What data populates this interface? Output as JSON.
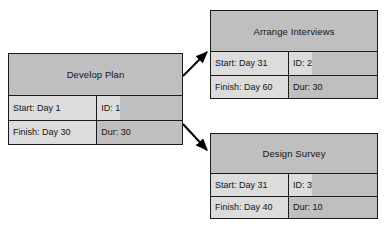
{
  "diagram": {
    "colors": {
      "node_fill_header": "#bfbfbf",
      "cell_light": "#dcdcdc",
      "cell_mid": "#bfbfbf",
      "border": "#1a1a1a",
      "arrow": "#000000",
      "background": "#ffffff"
    },
    "nodes": [
      {
        "id": "develop-plan",
        "title": "Develop Plan",
        "start": "Start: Day 1",
        "task_id": "ID: 1",
        "finish": "Finish: Day 30",
        "duration": "Dur: 30",
        "x": 8,
        "y": 53,
        "width": 175,
        "height": 92,
        "header_height": 42,
        "split_percent": 51
      },
      {
        "id": "arrange-interviews",
        "title": "Arrange Interviews",
        "start": "Start: Day 31",
        "task_id": "ID: 2",
        "finish": "Finish: Day 60",
        "duration": "Dur: 30",
        "x": 210,
        "y": 10,
        "width": 168,
        "height": 89,
        "header_height": 41,
        "split_percent": 47
      },
      {
        "id": "design-survey",
        "title": "Design Survey",
        "start": "Start: Day 31",
        "task_id": "ID: 3",
        "finish": "Finish: Day 40",
        "duration": "Dur: 10",
        "x": 210,
        "y": 133,
        "width": 168,
        "height": 86,
        "header_height": 40,
        "split_percent": 47
      }
    ],
    "arrows": [
      {
        "id": "develop-plan-to-arrange-interviews",
        "from": "develop-plan",
        "to": "arrange-interviews",
        "x1": 183,
        "y1": 76,
        "x2": 207,
        "y2": 52
      },
      {
        "id": "develop-plan-to-design-survey",
        "from": "develop-plan",
        "to": "design-survey",
        "x1": 183,
        "y1": 124,
        "x2": 207,
        "y2": 150
      }
    ]
  }
}
